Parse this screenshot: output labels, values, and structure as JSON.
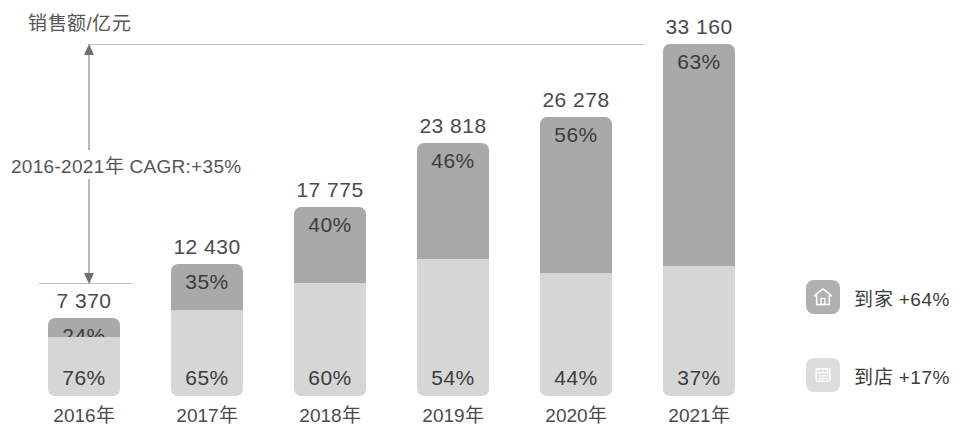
{
  "axis": {
    "y_title": "销售额/亿元"
  },
  "annotation": {
    "cagr_label": "2016-2021年 CAGR:+35%"
  },
  "legend": [
    {
      "icon": "home-icon",
      "label": "到家 +64%",
      "color": "#b0b0b0"
    },
    {
      "icon": "store-icon",
      "label": "到店 +17%",
      "color": "#dcdcdc"
    }
  ],
  "colors": {
    "to_home": "#a9a9a9",
    "to_store": "#d6d6d6",
    "text": "#3c3c3c",
    "reference_line": "#bdbdbd"
  },
  "chart_data": {
    "type": "bar",
    "title": "销售额/亿元",
    "xlabel": "",
    "ylabel": "销售额/亿元",
    "stacked": true,
    "grid": false,
    "legend_position": "right",
    "categories": [
      "2016年",
      "2017年",
      "2018年",
      "2019年",
      "2020年",
      "2021年"
    ],
    "totals": [
      "7 370",
      "12 430",
      "17 775",
      "23 818",
      "26 278",
      "33 160"
    ],
    "totals_numeric": [
      7370,
      12430,
      17775,
      23818,
      26278,
      33160
    ],
    "series": [
      {
        "name": "到家",
        "values": [
          24,
          35,
          40,
          46,
          56,
          63
        ],
        "labels": [
          "24%",
          "35%",
          "40%",
          "46%",
          "56%",
          "63%"
        ],
        "color": "#a9a9a9",
        "growth": "+64%"
      },
      {
        "name": "到店",
        "values": [
          76,
          65,
          60,
          54,
          44,
          37
        ],
        "labels": [
          "76%",
          "65%",
          "60%",
          "54%",
          "44%",
          "37%"
        ],
        "color": "#d6d6d6",
        "growth": "+17%"
      }
    ],
    "annotations": [
      "2016-2021年 CAGR:+35%"
    ]
  }
}
